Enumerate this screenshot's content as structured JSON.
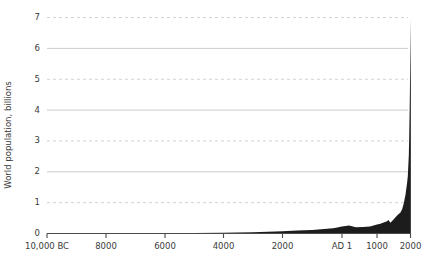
{
  "chart_data": {
    "type": "area",
    "title": "",
    "xlabel": "",
    "ylabel": "World population, billions",
    "xlim": [
      -10000,
      2000
    ],
    "ylim": [
      0,
      7.4
    ],
    "grid": true,
    "legend": null,
    "x_tick_labels": [
      "10,000 BC",
      "8000",
      "6000",
      "4000",
      "2000",
      "AD 1",
      "1000",
      "2000"
    ],
    "x_tick_years": [
      -10000,
      -8000,
      -6000,
      -4000,
      -2000,
      1,
      1000,
      2000
    ],
    "y_tick_labels": [
      "0",
      "1",
      "2",
      "3",
      "4",
      "5",
      "6",
      "7"
    ],
    "y_tick_values": [
      0,
      1,
      2,
      3,
      4,
      5,
      6,
      7
    ],
    "series": [
      {
        "name": "World population",
        "units": "billions",
        "x": [
          -10000,
          -9000,
          -8000,
          -7000,
          -6000,
          -5000,
          -4000,
          -3000,
          -2000,
          -1500,
          -1000,
          -800,
          -500,
          -400,
          -300,
          -200,
          1,
          200,
          400,
          600,
          800,
          1000,
          1100,
          1200,
          1300,
          1340,
          1400,
          1500,
          1600,
          1700,
          1750,
          1800,
          1850,
          1900,
          1920,
          1950,
          1960,
          1970,
          1980,
          1990,
          2000,
          2010
        ],
        "values": [
          0.004,
          0.005,
          0.007,
          0.01,
          0.015,
          0.02,
          0.028,
          0.04,
          0.072,
          0.1,
          0.115,
          0.13,
          0.15,
          0.162,
          0.172,
          0.19,
          0.23,
          0.257,
          0.206,
          0.208,
          0.224,
          0.295,
          0.32,
          0.36,
          0.4,
          0.44,
          0.35,
          0.46,
          0.58,
          0.68,
          0.79,
          0.98,
          1.26,
          1.65,
          1.86,
          2.54,
          3.03,
          3.7,
          4.44,
          5.32,
          6.14,
          6.96
        ]
      }
    ],
    "annotations": []
  },
  "colors": {
    "series_fill": "#1c1c1c",
    "gridline": "#c6c6c6",
    "axis": "#4a4a4a",
    "text": "#3a3a3a",
    "background": "#ffffff"
  }
}
